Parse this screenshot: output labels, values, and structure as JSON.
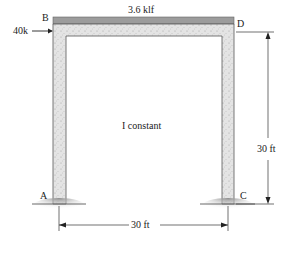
{
  "diagram": {
    "type": "structural-frame",
    "load": {
      "label": "3.6 klf",
      "type": "uniform-distributed"
    },
    "lateral_load": {
      "label": "40k",
      "at_node": "B",
      "direction": "right"
    },
    "nodes": {
      "A": "A",
      "B": "B",
      "C": "C",
      "D": "D"
    },
    "note": "I constant",
    "dimensions": {
      "height": "30 ft",
      "span": "30 ft"
    },
    "colors": {
      "member_fill": "#e2e2e2",
      "member_stroke": "#555555",
      "load_strip": "#9a9a9a",
      "ground": "#b5b5b5",
      "line": "#333333"
    }
  }
}
